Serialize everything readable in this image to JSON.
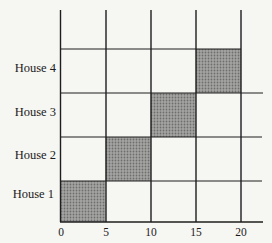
{
  "chart_data": {
    "type": "gantt",
    "title": "",
    "xlabel": "",
    "ylabel": "",
    "x_ticks": [
      "0",
      "5",
      "10",
      "15",
      "20"
    ],
    "xlim": [
      0,
      20
    ],
    "categories": [
      "House 1",
      "House 2",
      "House 3",
      "House 4"
    ],
    "tasks": [
      {
        "name": "House 1",
        "start": 0,
        "end": 5
      },
      {
        "name": "House 2",
        "start": 5,
        "end": 10
      },
      {
        "name": "House 3",
        "start": 10,
        "end": 15
      },
      {
        "name": "House 4",
        "start": 15,
        "end": 20
      }
    ],
    "grid": true,
    "legend": null,
    "bar_color": "#9a9a9a"
  },
  "labels": {
    "y": [
      "House 4",
      "House 3",
      "House 2",
      "House 1"
    ],
    "x": [
      "0",
      "5",
      "10",
      "15",
      "20"
    ]
  }
}
